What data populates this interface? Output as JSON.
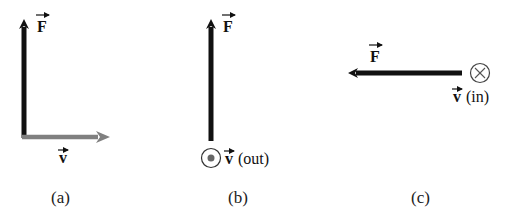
{
  "panels": [
    {
      "id": "a",
      "caption": "(a)",
      "force": {
        "label": "F",
        "direction": "up",
        "color": "#111111"
      },
      "velocity": {
        "label": "v",
        "direction": "right",
        "color": "#808080",
        "suffix": ""
      }
    },
    {
      "id": "b",
      "caption": "(b)",
      "force": {
        "label": "F",
        "direction": "up",
        "color": "#111111"
      },
      "velocity": {
        "label": "v",
        "direction": "out-of-page",
        "symbol": "dot-in-circle",
        "suffix": "(out)"
      }
    },
    {
      "id": "c",
      "caption": "(c)",
      "force": {
        "label": "F",
        "direction": "left",
        "color": "#111111"
      },
      "velocity": {
        "label": "v",
        "direction": "into-page",
        "symbol": "cross-in-circle",
        "suffix": "(in)"
      }
    }
  ]
}
